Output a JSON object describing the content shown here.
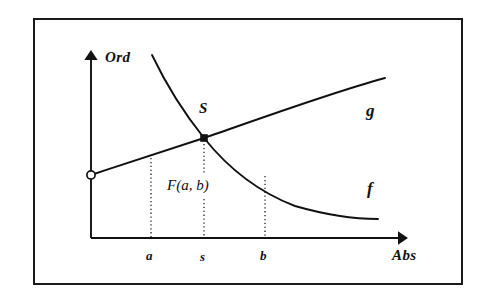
{
  "figure": {
    "kind": "function-intersection-diagram",
    "background_color": "#ffffff",
    "ink_color": "#111111",
    "frame": {
      "border_color": "#1a1a1a",
      "border_width_px": 2
    }
  },
  "axes": {
    "ordinate_label": "Ord",
    "abscissa_label": "Abs",
    "vertical_axis_name": "ordinate-axis",
    "horizontal_axis_name": "abscissa-axis",
    "arrowheads": "both-axes-outward"
  },
  "curves": [
    {
      "name": "curve-f",
      "label": "f",
      "shape": "decreasing-convex",
      "description": "steeply falling convex curve flattening toward the right",
      "points": [
        [
          152,
          55
        ],
        [
          172,
          86
        ],
        [
          190,
          113
        ],
        [
          204,
          138
        ],
        [
          224,
          166
        ],
        [
          250,
          188
        ],
        [
          285,
          204
        ],
        [
          330,
          214
        ],
        [
          378,
          219
        ]
      ]
    },
    {
      "name": "curve-g",
      "label": "g",
      "shape": "increasing-concave",
      "description": "rising slightly concave line from the open circle on the ordinate axis",
      "points": [
        [
          91,
          175
        ],
        [
          130,
          162
        ],
        [
          170,
          149
        ],
        [
          204,
          138
        ],
        [
          250,
          122
        ],
        [
          300,
          103
        ],
        [
          345,
          88
        ],
        [
          385,
          78
        ]
      ]
    }
  ],
  "markers": [
    {
      "name": "intersection-point",
      "label": "S",
      "style": "filled-square",
      "x": 204,
      "y": 138
    },
    {
      "name": "open-circle-marker",
      "label": "",
      "style": "open-circle",
      "x": 91,
      "y": 175
    }
  ],
  "annotations": {
    "intersection_label": "S",
    "fixed_point_label": "F(a, b)"
  },
  "ticks": [
    {
      "name": "tick-a",
      "label": "a",
      "x": 151,
      "dotted_from_y": 158,
      "dotted_to_y": 238
    },
    {
      "name": "tick-s",
      "label": "s",
      "x": 204,
      "dotted_from_y": 144,
      "dotted_to_y": 238
    },
    {
      "name": "tick-b",
      "label": "b",
      "x": 265,
      "dotted_from_y": 176,
      "dotted_to_y": 238
    }
  ]
}
